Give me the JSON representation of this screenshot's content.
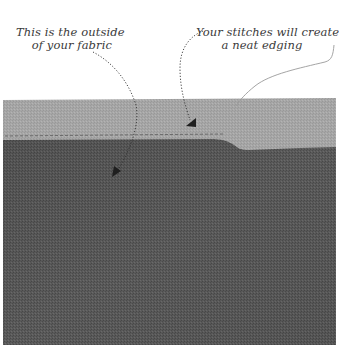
{
  "image": {
    "description": "Instructional sewing illustration showing fabric with annotations",
    "colors": {
      "background": "#ffffff",
      "fabric_outside_light": "#a9a9a9",
      "fabric_inside_dark": "#5c5c5c",
      "annotation_text": "#3a3a3a"
    }
  },
  "annotations": {
    "left": {
      "line1": "This is the outside",
      "line2": "of your fabric"
    },
    "right": {
      "line1": "Your stitches will create",
      "line2": "a neat edging"
    }
  }
}
